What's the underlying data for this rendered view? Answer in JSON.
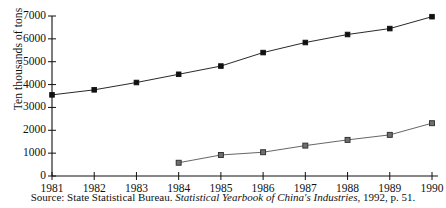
{
  "chart_data": {
    "type": "line",
    "title": "",
    "xlabel": "",
    "ylabel": "Ten thousands of tons",
    "x": [
      1981,
      1982,
      1983,
      1984,
      1985,
      1986,
      1987,
      1988,
      1989,
      1990
    ],
    "categories": [
      "1981",
      "1982",
      "1983",
      "1984",
      "1985",
      "1986",
      "1987",
      "1988",
      "1989",
      "1990"
    ],
    "xlim": [
      1981,
      1990
    ],
    "ylim": [
      0,
      7000
    ],
    "yticks": [
      0,
      1000,
      2000,
      3000,
      4000,
      5000,
      6000,
      7000
    ],
    "ytick_labels": [
      "0",
      "1000",
      "2000",
      "3000",
      "4000",
      "5000",
      "6000",
      "7000"
    ],
    "grid": false,
    "legend": "none",
    "series": [
      {
        "name": "upper-series",
        "marker": "filled-square-black",
        "color": "#111111",
        "x": [
          1981,
          1982,
          1983,
          1984,
          1985,
          1986,
          1987,
          1988,
          1989,
          1990
        ],
        "values": [
          3550,
          3770,
          4090,
          4450,
          4810,
          5400,
          5840,
          6190,
          6450,
          6970
        ]
      },
      {
        "name": "lower-series",
        "marker": "square-gray",
        "color": "#555555",
        "x": [
          1984,
          1985,
          1986,
          1987,
          1988,
          1989,
          1990
        ],
        "values": [
          580,
          920,
          1040,
          1330,
          1580,
          1800,
          2310
        ]
      }
    ]
  },
  "source": {
    "prefix": "Source: State Statistical Bureau. ",
    "italic": "Statistical Yearbook of China's Industries",
    "suffix": ", 1992, p. 51."
  }
}
